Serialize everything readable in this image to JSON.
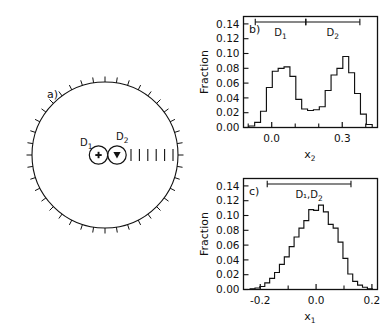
{
  "figure": {
    "panels": [
      {
        "id": "a",
        "label": "a)",
        "type": "diagram",
        "description": "circular-detector-array",
        "detectors": [
          {
            "name": "D",
            "subscript": "1",
            "label": "D₁",
            "marker": "plus-in-circle"
          },
          {
            "name": "D",
            "subscript": "2",
            "label": "D₂",
            "marker": "triangle-in-circle"
          }
        ],
        "circle_ticks": 40,
        "dash_count": 6
      },
      {
        "id": "b",
        "label": "b)",
        "type": "histogram"
      },
      {
        "id": "c",
        "label": "c)",
        "type": "histogram"
      }
    ]
  },
  "chart_data": [
    {
      "panel": "b",
      "type": "bar",
      "title": "b)",
      "xlabel": "x₂",
      "ylabel": "Fraction",
      "xlim": [
        -0.12,
        0.45
      ],
      "ylim": [
        0.0,
        0.15
      ],
      "ytick_labels": [
        "0.00",
        "0.02",
        "0.04",
        "0.06",
        "0.08",
        "0.10",
        "0.12",
        "0.14"
      ],
      "ytick_values": [
        0.0,
        0.02,
        0.04,
        0.06,
        0.08,
        0.1,
        0.12,
        0.14
      ],
      "xtick_labels": [
        "0.0",
        "0.3"
      ],
      "xtick_values": [
        0.0,
        0.3
      ],
      "xminor_values": [
        -0.1,
        0.1,
        0.2,
        0.4
      ],
      "grid": false,
      "legend": "none",
      "annotations": [
        {
          "text": "D₁",
          "label_plain": "D1",
          "range": [
            -0.07,
            0.145
          ]
        },
        {
          "text": "D₂",
          "label_plain": "D2",
          "range": [
            0.145,
            0.375
          ]
        }
      ],
      "bin_width": 0.025,
      "x": [
        -0.11,
        -0.085,
        -0.06,
        -0.035,
        -0.01,
        0.015,
        0.04,
        0.065,
        0.09,
        0.115,
        0.14,
        0.165,
        0.19,
        0.215,
        0.24,
        0.265,
        0.29,
        0.315,
        0.34,
        0.365,
        0.39,
        0.415
      ],
      "values": [
        0.0,
        0.002,
        0.007,
        0.022,
        0.054,
        0.076,
        0.08,
        0.082,
        0.069,
        0.038,
        0.025,
        0.023,
        0.024,
        0.028,
        0.05,
        0.071,
        0.08,
        0.096,
        0.074,
        0.046,
        0.018,
        0.004
      ]
    },
    {
      "panel": "c",
      "type": "bar",
      "title": "c)",
      "xlabel": "x₁",
      "ylabel": "Fraction",
      "xlim": [
        -0.26,
        0.22
      ],
      "ylim": [
        0.0,
        0.15
      ],
      "ytick_labels": [
        "0.00",
        "0.02",
        "0.04",
        "0.06",
        "0.08",
        "0.10",
        "0.12",
        "0.14"
      ],
      "ytick_values": [
        0.0,
        0.02,
        0.04,
        0.06,
        0.08,
        0.1,
        0.12,
        0.14
      ],
      "xtick_labels": [
        "-0.2",
        "0.0",
        "0.2"
      ],
      "xtick_values": [
        -0.2,
        0.0,
        0.2
      ],
      "xminor_values": [
        -0.1,
        0.1
      ],
      "grid": false,
      "legend": "none",
      "annotations": [
        {
          "text": "D₁,D₂",
          "label_plain": "D1,D2",
          "range": [
            -0.175,
            0.125
          ]
        }
      ],
      "bin_width": 0.0175,
      "x": [
        -0.245,
        -0.2275,
        -0.21,
        -0.1925,
        -0.175,
        -0.1575,
        -0.14,
        -0.1225,
        -0.105,
        -0.0875,
        -0.07,
        -0.0525,
        -0.035,
        -0.0175,
        0.0,
        0.0175,
        0.035,
        0.0525,
        0.07,
        0.0875,
        0.105,
        0.1225,
        0.14,
        0.1575,
        0.175,
        0.1925
      ],
      "values": [
        0.0,
        0.001,
        0.002,
        0.004,
        0.009,
        0.015,
        0.023,
        0.034,
        0.044,
        0.058,
        0.071,
        0.083,
        0.093,
        0.108,
        0.107,
        0.114,
        0.105,
        0.088,
        0.083,
        0.064,
        0.042,
        0.021,
        0.011,
        0.006,
        0.003,
        0.001
      ]
    }
  ]
}
